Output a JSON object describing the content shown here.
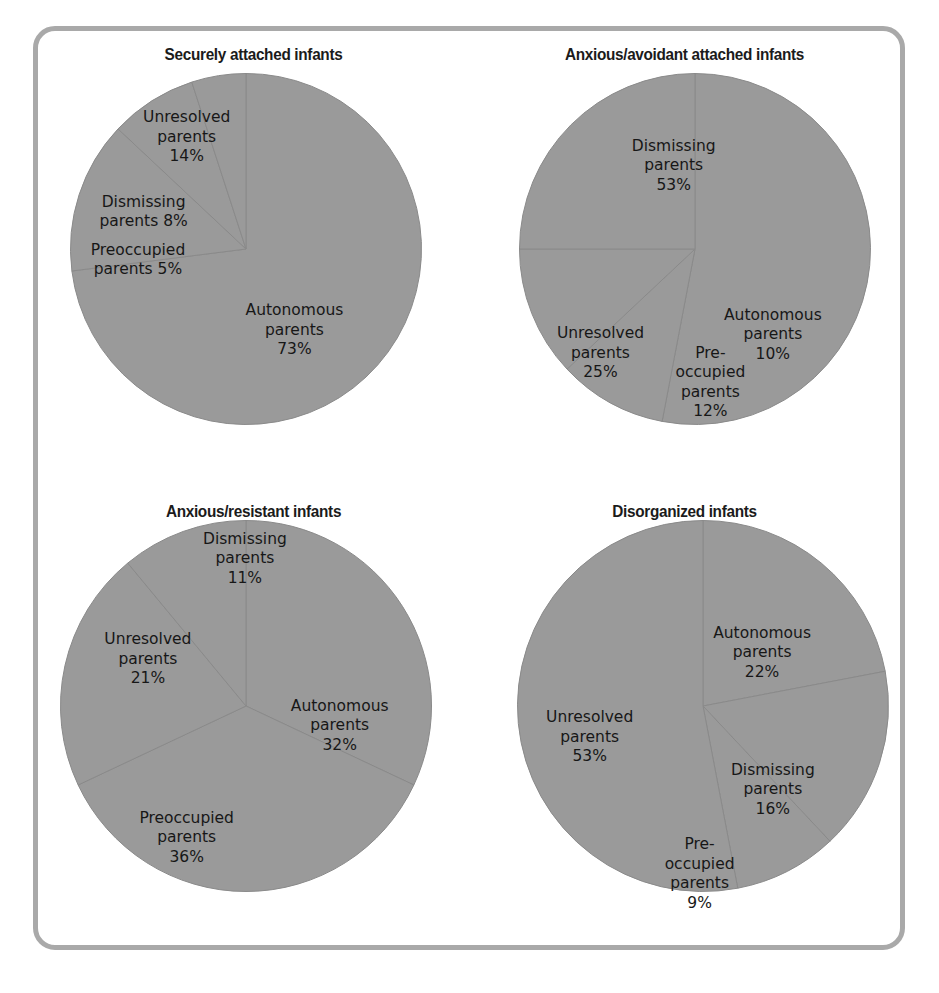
{
  "figure": {
    "border_color": "#a9a9a9",
    "background_color": "#ffffff",
    "slice_fill_color": "#9a9a9a",
    "slice_edge_color": "#8a8a8a",
    "label_color": "#171717",
    "title_color": "#1b1b1b"
  },
  "chart_data": [
    {
      "type": "pie",
      "title": "Securely attached infants",
      "categories": [
        "Autonomous parents",
        "Unresolved parents",
        "Dismissing parents",
        "Preoccupied parents"
      ],
      "values": [
        73,
        14,
        8,
        5
      ],
      "labels": [
        {
          "name": "Autonomous parents",
          "text": "Autonomous\nparents\n73%",
          "value": 73,
          "percent": "73%"
        },
        {
          "name": "Unresolved parents",
          "text": "Unresolved\nparents\n14%",
          "value": 14,
          "percent": "14%"
        },
        {
          "name": "Dismissing parents",
          "text": "Dismissing\nparents  8%",
          "value": 8,
          "percent": "8%"
        },
        {
          "name": "Preoccupied parents",
          "text": "Preoccupied\nparents  5%",
          "value": 5,
          "percent": "5%"
        }
      ],
      "start_angle": 0,
      "direction": "clockwise",
      "legend": "none"
    },
    {
      "type": "pie",
      "title": "Anxious/avoidant attached infants",
      "categories": [
        "Dismissing parents",
        "Autonomous parents",
        "Preoccupied parents",
        "Unresolved parents"
      ],
      "values": [
        53,
        10,
        12,
        25
      ],
      "labels": [
        {
          "name": "Dismissing parents",
          "text": "Dismissing\nparents\n53%",
          "value": 53,
          "percent": "53%"
        },
        {
          "name": "Autonomous parents",
          "text": "Autonomous\nparents\n10%",
          "value": 10,
          "percent": "10%"
        },
        {
          "name": "Preoccupied parents",
          "text": "Pre-\noccupied\nparents\n12%",
          "value": 12,
          "percent": "12%"
        },
        {
          "name": "Unresolved parents",
          "text": "Unresolved\nparents\n25%",
          "value": 25,
          "percent": "25%"
        }
      ],
      "start_angle": 0,
      "direction": "clockwise",
      "legend": "none"
    },
    {
      "type": "pie",
      "title": "Anxious/resistant infants",
      "categories": [
        "Autonomous parents",
        "Preoccupied parents",
        "Unresolved parents",
        "Dismissing parents"
      ],
      "values": [
        32,
        36,
        21,
        11
      ],
      "labels": [
        {
          "name": "Autonomous parents",
          "text": "Autonomous\nparents\n32%",
          "value": 32,
          "percent": "32%"
        },
        {
          "name": "Preoccupied parents",
          "text": "Preoccupied\nparents\n36%",
          "value": 36,
          "percent": "36%"
        },
        {
          "name": "Unresolved parents",
          "text": "Unresolved\nparents\n21%",
          "value": 21,
          "percent": "21%"
        },
        {
          "name": "Dismissing parents",
          "text": "Dismissing\nparents\n11%",
          "value": 11,
          "percent": "11%"
        }
      ],
      "start_angle": 0,
      "direction": "clockwise",
      "legend": "none"
    },
    {
      "type": "pie",
      "title": "Disorganized infants",
      "categories": [
        "Autonomous parents",
        "Dismissing parents",
        "Preoccupied parents",
        "Unresolved parents"
      ],
      "values": [
        22,
        16,
        9,
        53
      ],
      "labels": [
        {
          "name": "Autonomous parents",
          "text": "Autonomous\nparents\n22%",
          "value": 22,
          "percent": "22%"
        },
        {
          "name": "Dismissing parents",
          "text": "Dismissing\nparents\n16%",
          "value": 16,
          "percent": "16%"
        },
        {
          "name": "Preoccupied parents",
          "text": "Pre-\noccupied\nparents\n9%",
          "value": 9,
          "percent": "9%"
        },
        {
          "name": "Unresolved parents",
          "text": "Unresolved\nparents\n53%",
          "value": 53,
          "percent": "53%"
        }
      ],
      "start_angle": 0,
      "direction": "clockwise",
      "legend": "none"
    }
  ],
  "label_positions": [
    [
      {
        "x": 0.595,
        "y": 0.655
      },
      {
        "x": 0.345,
        "y": 0.232
      },
      {
        "x": 0.245,
        "y": 0.395
      },
      {
        "x": 0.232,
        "y": 0.5
      }
    ],
    [
      {
        "x": 0.475,
        "y": 0.295
      },
      {
        "x": 0.705,
        "y": 0.665
      },
      {
        "x": 0.56,
        "y": 0.77
      },
      {
        "x": 0.305,
        "y": 0.705
      }
    ],
    [
      {
        "x": 0.7,
        "y": 0.52
      },
      {
        "x": 0.345,
        "y": 0.765
      },
      {
        "x": 0.255,
        "y": 0.375
      },
      {
        "x": 0.48,
        "y": 0.155
      }
    ],
    [
      {
        "x": 0.68,
        "y": 0.36
      },
      {
        "x": 0.705,
        "y": 0.66
      },
      {
        "x": 0.535,
        "y": 0.845
      },
      {
        "x": 0.28,
        "y": 0.545
      }
    ]
  ]
}
